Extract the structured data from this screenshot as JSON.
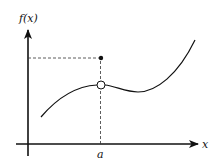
{
  "diagram": {
    "type": "function-graph-removable-discontinuity",
    "y_axis_label": "f(x)",
    "x_axis_label": "x",
    "point_label": "a",
    "colors": {
      "stroke": "#111111",
      "background": "#ffffff"
    },
    "elements": {
      "curve": "smooth cubic-like curve with removable discontinuity at x=a",
      "open_circle": "hole in curve at x=a",
      "filled_dot": "function value at x=a, above the curve",
      "dashed_lines": [
        "vertical dashed line from x-axis at a up to filled dot",
        "horizontal dashed line from y-axis to filled dot"
      ]
    }
  }
}
